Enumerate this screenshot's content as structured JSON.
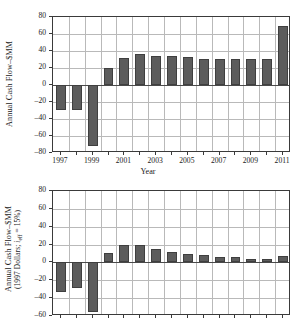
{
  "figure": {
    "background": "#ffffff",
    "bar_color": "#5c5c5c",
    "bar_edge_color": "#3f3f3f",
    "grid_color": "#b9b9b9",
    "axis_color": "#3a3a3a"
  },
  "chart_data": [
    {
      "id": "top",
      "type": "bar",
      "title": "",
      "xlabel": "Year",
      "ylabel_line1": "Annual Cash Flow–$MM",
      "ylabel_line2": "",
      "categories": [
        1997,
        1998,
        1999,
        2000,
        2001,
        2002,
        2003,
        2004,
        2005,
        2006,
        2007,
        2008,
        2009,
        2010,
        2011
      ],
      "values": [
        -29,
        -29,
        -72,
        20,
        32,
        37,
        34.5,
        34,
        32.5,
        31,
        31,
        31,
        31,
        31,
        70
      ],
      "ylim": [
        -80,
        80
      ],
      "yticks": [
        80,
        60,
        40,
        20,
        0,
        -20,
        -40,
        -60,
        -80
      ],
      "xlim": [
        1996.5,
        2011.5
      ],
      "xticks_labeled": [
        1997,
        1999,
        2001,
        2003,
        2005,
        2007,
        2009,
        2011
      ],
      "xticks_minor": [
        1998,
        2000,
        2002,
        2004,
        2006,
        2008,
        2010
      ],
      "grid": true,
      "legend": "none"
    },
    {
      "id": "bottom",
      "type": "bar",
      "title": "",
      "xlabel": "",
      "ylabel_line1": "Annual Cash Flow–$MM",
      "ylabel_line2_pre": "(1997 Dollars; ",
      "ylabel_line2_var": "i",
      "ylabel_line2_sub": "eff",
      "ylabel_line2_post": " = 15%)",
      "categories": [
        1997,
        1998,
        1999,
        2000,
        2001,
        2002,
        2003,
        2004,
        2005,
        2006,
        2007,
        2008,
        2009,
        2010,
        2011
      ],
      "values": [
        -33,
        -29,
        -55,
        11,
        19,
        19,
        15,
        12,
        9,
        8.5,
        6,
        6,
        3.5,
        3.5,
        7
      ],
      "ylim": [
        -60,
        80
      ],
      "yticks": [
        80,
        60,
        40,
        20,
        0,
        -20,
        -40,
        -60
      ],
      "xlim": [
        1996.5,
        2011.5
      ],
      "xticks_labeled": [],
      "xticks_minor": [
        1998,
        2000,
        2002,
        2004,
        2006,
        2008,
        2010
      ],
      "grid": true,
      "legend": "none",
      "note": "axis cropped at image bottom edge"
    }
  ]
}
